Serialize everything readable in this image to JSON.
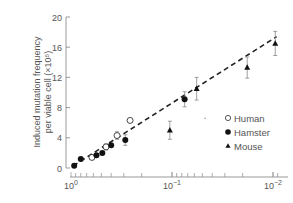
{
  "chart_data": {
    "type": "scatter",
    "title": "",
    "ylabel_line1": "Induced mutation frequency",
    "ylabel_line2": "per viable cell (×10⁵)",
    "xlabel": "",
    "xscale": "log-reversed",
    "x_ticks": [
      {
        "value": 1,
        "label": "10",
        "exp": "0"
      },
      {
        "value": 0.1,
        "label": "10",
        "exp": "−1"
      },
      {
        "value": 0.01,
        "label": "10",
        "exp": "−2"
      }
    ],
    "y_ticks": [
      0,
      4,
      8,
      12,
      16,
      20
    ],
    "ylim": [
      0,
      20
    ],
    "xlim": [
      1.0,
      0.008
    ],
    "legend": [
      {
        "name": "Human",
        "marker": "open-circle"
      },
      {
        "name": "Hamster",
        "marker": "filled-circle"
      },
      {
        "name": "Mouse",
        "marker": "filled-triangle"
      }
    ],
    "series": [
      {
        "name": "Human",
        "marker": "open-circle",
        "points": [
          {
            "x": 0.62,
            "y": 1.4
          },
          {
            "x": 0.45,
            "y": 2.8,
            "err": 0.4
          },
          {
            "x": 0.35,
            "y": 4.3,
            "err": 0.5
          },
          {
            "x": 0.26,
            "y": 6.3
          }
        ]
      },
      {
        "name": "Hamster",
        "marker": "filled-circle",
        "points": [
          {
            "x": 0.93,
            "y": 0.3
          },
          {
            "x": 0.8,
            "y": 1.2
          },
          {
            "x": 0.56,
            "y": 1.7
          },
          {
            "x": 0.49,
            "y": 2.0
          },
          {
            "x": 0.4,
            "y": 3.0
          },
          {
            "x": 0.29,
            "y": 3.7,
            "err": 0.7
          },
          {
            "x": 0.075,
            "y": 9.1,
            "err": 1.0
          }
        ]
      },
      {
        "name": "Mouse",
        "marker": "filled-triangle",
        "points": [
          {
            "x": 0.105,
            "y": 5.0,
            "err": 1.2
          },
          {
            "x": 0.057,
            "y": 10.5,
            "err": 1.5
          },
          {
            "x": 0.018,
            "y": 13.3,
            "err": 1.4
          },
          {
            "x": 0.0095,
            "y": 16.5,
            "err": 1.6
          }
        ]
      }
    ],
    "fit_line": {
      "style": "dashed",
      "from": {
        "x": 0.95,
        "y": 0.3
      },
      "to": {
        "x": 0.0092,
        "y": 17.4
      }
    }
  }
}
